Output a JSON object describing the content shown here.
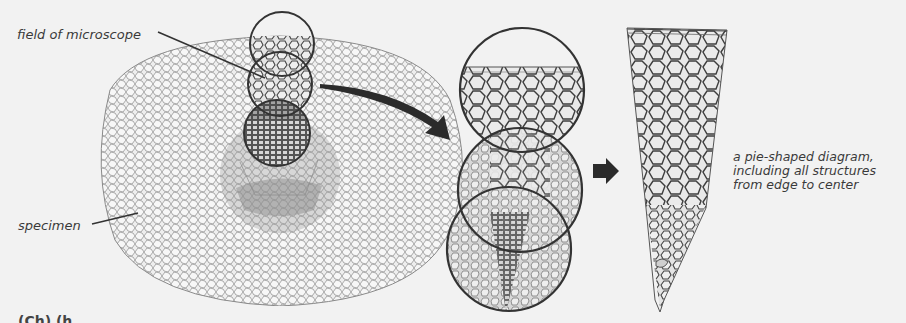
{
  "figure": {
    "labels": {
      "field_of_microscope": "field of microscope",
      "specimen": "specimen",
      "pie_diagram_line1": "a pie-shaped diagram,",
      "pie_diagram_line2": "including all structures",
      "pie_diagram_line3": "from edge to center"
    },
    "panels": [
      {
        "name": "whole-specimen",
        "description": "cross-section specimen with three overlapping microscope field circles"
      },
      {
        "name": "magnified-fields",
        "description": "three stacked magnified microscope fields"
      },
      {
        "name": "pie-diagram",
        "description": "wedge-shaped composite diagram from edge to center"
      }
    ],
    "cutoff_caption": "(Ch) (h"
  },
  "colors": {
    "background": "#f2f2f2",
    "ink": "#2b2b2b",
    "cell_wall": "#555555",
    "cell_fill": "#e4e4e4",
    "shade": "#9a9a9a"
  }
}
